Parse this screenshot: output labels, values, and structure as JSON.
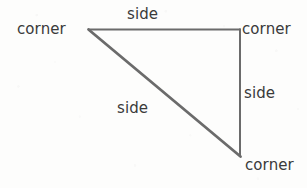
{
  "figure": {
    "background_color": "#fdfdfc",
    "stroke_color": "#6b6b6b",
    "text_color": "#3a3a3a",
    "width": 307,
    "height": 188,
    "vertices": {
      "left": {
        "x": 88,
        "y": 29
      },
      "top_right": {
        "x": 240,
        "y": 29
      },
      "bottom_right": {
        "x": 240,
        "y": 156
      }
    },
    "edges": [
      {
        "name": "top-edge",
        "from": "left",
        "to": "top_right",
        "stroke_width": 2.0
      },
      {
        "name": "right-edge",
        "from": "top_right",
        "to": "bottom_right",
        "stroke_width": 2.0
      },
      {
        "name": "hypotenuse-edge",
        "from": "bottom_right",
        "to": "left",
        "stroke_width": 2.8
      }
    ]
  },
  "labels": {
    "corner_left": "corner",
    "corner_top_right": "corner",
    "corner_bottom_right": "corner",
    "side_top": "side",
    "side_right": "side",
    "side_diagonal": "side"
  }
}
